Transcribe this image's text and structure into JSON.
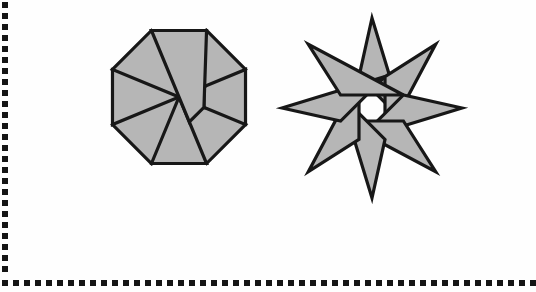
{
  "page": {
    "width": 536,
    "height": 292,
    "background_color": "#fefefe"
  },
  "border": {
    "style": "dotted",
    "dot_color": "#141414",
    "dot_size_px": 6,
    "dot_gap_px": 5,
    "left_edge_dot_count": 25,
    "bottom_edge_dot_count": 49,
    "edges": [
      "left",
      "bottom"
    ]
  },
  "figures": [
    {
      "id": "octagon-pinwheel",
      "name": "Octagonal pinwheel",
      "shape_type": "pinwheel",
      "outline": "octagon",
      "blade_count": 8,
      "rotation_direction": "clockwise",
      "fill_color": "#b6b6b6",
      "stroke_color": "#171717",
      "stroke_width": 3.2,
      "bounds": {
        "x": 110,
        "y": 28,
        "width": 137,
        "height": 137
      },
      "center": {
        "x": 178,
        "y": 96
      },
      "inner_hole": "octagon"
    },
    {
      "id": "star-pinwheel",
      "name": "Eight-pointed pinwheel star",
      "shape_type": "pinwheel",
      "outline": "8-pointed star",
      "blade_count": 8,
      "point_count": 8,
      "rotation_direction": "clockwise",
      "fill_color": "#b6b6b6",
      "stroke_color": "#171717",
      "stroke_width": 3.2,
      "bounds": {
        "x": 283,
        "y": 23,
        "width": 179,
        "height": 170
      },
      "center": {
        "x": 372,
        "y": 108
      },
      "inner_hole": "octagon"
    }
  ],
  "geometry": {
    "octagon": {
      "viewbox": "0 0 150 150",
      "center": [
        75,
        75
      ],
      "outer_radius": 72,
      "inner_radius": 27,
      "blades": [
        "M75,3 L126.9,24.5 L99.9,51.5 Z",
        "M126.9,24.5 L148.4,75 L111.5,87.2 Z",
        "M148.4,75 L126.9,125.5 L99.9,98.5 Z",
        "M126.9,125.5 L75,147 L87.2,111.5 Z",
        "M75,147 L24.5,125.5 L51.5,98.5 Z",
        "M24.5,125.5 L3,75 L38.5,62.8 Z",
        "M3,75 L24.5,24.5 L51.5,51.5 Z",
        "M24.5,24.5 L75,3 L62.8,38.5 Z"
      ]
    },
    "star": {
      "viewbox": "0 0 192 185",
      "center": [
        96,
        92
      ],
      "point_radius": 90,
      "inner_radius": 34,
      "blade_count": 8
    }
  },
  "labels": {
    "figure_left_caption": "",
    "figure_right_caption": ""
  }
}
